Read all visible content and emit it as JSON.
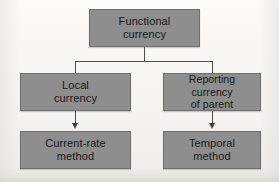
{
  "diagram": {
    "type": "flowchart",
    "background_color": "#f6f5f3",
    "node_fill_color": "#8e8e8e",
    "node_border_color": "#6f6f6f",
    "node_text_color": "#17171a",
    "connector_color": "#4d4d4d",
    "nodes": [
      {
        "id": "functional-currency",
        "label": "Functional\ncurrency",
        "level": 0
      },
      {
        "id": "local-currency",
        "label": "Local\ncurrency",
        "level": 1
      },
      {
        "id": "reporting-currency-of-parent",
        "label": "Reporting currency\nof parent",
        "level": 1
      },
      {
        "id": "current-rate-method",
        "label": "Current-rate\nmethod",
        "level": 2
      },
      {
        "id": "temporal-method",
        "label": "Temporal\nmethod",
        "level": 2
      }
    ],
    "edges": [
      {
        "from": "functional-currency",
        "to": "local-currency",
        "style": "elbow",
        "arrow": false
      },
      {
        "from": "functional-currency",
        "to": "reporting-currency-of-parent",
        "style": "elbow",
        "arrow": false
      },
      {
        "from": "local-currency",
        "to": "current-rate-method",
        "style": "straight",
        "arrow": true
      },
      {
        "from": "reporting-currency-of-parent",
        "to": "temporal-method",
        "style": "straight",
        "arrow": true
      }
    ]
  }
}
